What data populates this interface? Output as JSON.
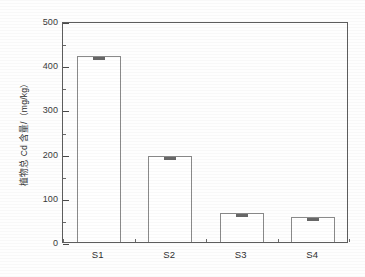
{
  "chart_data": {
    "type": "bar",
    "title": "",
    "subtitle": "",
    "xlabel": "",
    "ylabel": "植物总 Cd 含量/（mg/kg）",
    "categories": [
      "S1",
      "S2",
      "S3",
      "S4"
    ],
    "values": [
      421,
      195,
      66,
      57
    ],
    "errors": [
      6,
      4,
      3,
      3
    ],
    "ylim": [
      0,
      500
    ],
    "ytick_major": [
      0,
      100,
      200,
      300,
      400,
      500
    ],
    "ytick_minor": [
      50,
      150,
      250,
      350,
      450
    ],
    "ytick_labels": [
      "0",
      "100",
      "200",
      "300",
      "400",
      "500"
    ],
    "grid": false,
    "legend": null,
    "bar_fill": "#ffffff",
    "bar_edge": "#8a8a8a",
    "frame_color": "#5d5d5d",
    "error_marker_color": "#3c3c3c",
    "background": "#fefefe",
    "annotations": []
  }
}
